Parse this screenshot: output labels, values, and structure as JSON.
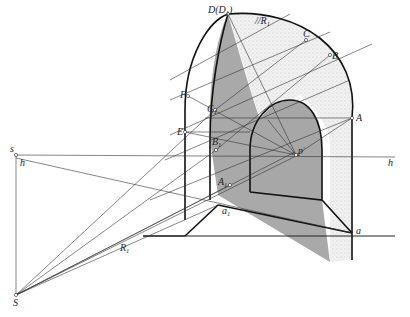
{
  "diagram": {
    "title": "",
    "type": "perspective shadow construction of an arched niche",
    "colors": {
      "shadow": "#a9a9a9",
      "lit_surface_stipple": "#ececec",
      "line": "#222222",
      "background": "#ffffff"
    },
    "labels": {
      "D": "D(D",
      "D_sub": "1",
      "D_close": ")",
      "C": "C",
      "B": "B",
      "A": "A",
      "F": "F",
      "C1": "C",
      "C1_sub": "1",
      "E": "E",
      "B1": "B",
      "B1_sub": "1",
      "A1": "A",
      "A1_sub": "1",
      "a1": "a",
      "a1_sub": "1",
      "a": "a",
      "p": "p",
      "p_prime": "′",
      "s": "s",
      "h_left": "h",
      "h_right": "h",
      "S": "S",
      "R1": "R",
      "R1_sub": "1",
      "parallel_R1": "//R",
      "parallel_R1_sub": "1"
    }
  }
}
